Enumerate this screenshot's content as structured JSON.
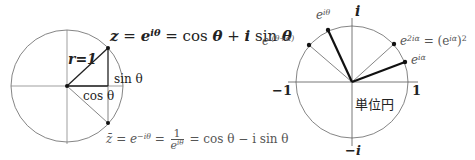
{
  "left_diagram": {
    "radius_label": "r=1",
    "z_formula": {
      "lhs": "z",
      "eq1": " = ",
      "exp_base": "e",
      "exp_sup": "iθ",
      "eq2": " = cos ",
      "theta1": "θ",
      "plus": " + ",
      "i": "i",
      "sin": " sin ",
      "theta2": "θ"
    },
    "sin_label": "sin θ",
    "cos_label": "cos θ",
    "conj_formula": {
      "lhs": "z̄ = e",
      "lhs_sup": "−iθ",
      "eq": " = ",
      "frac_num": "1",
      "frac_den_base": "e",
      "frac_den_sup": "iθ",
      "rhs": " = cos θ − i sin θ"
    }
  },
  "right_diagram": {
    "axis_i": "i",
    "axis_neg_i": "−i",
    "axis_pos_1": "1",
    "axis_neg_1": "−1",
    "unit_circle_label": "単位円",
    "points": [
      {
        "base": "e",
        "sup": "iθ"
      },
      {
        "base": "e",
        "sup": "i(θ+α)"
      },
      {
        "base": "e",
        "sup": "2iα",
        "suffix": " = (e",
        "suffix_sup": "iα",
        "suffix_end": ")",
        "suffix_sup2": "2"
      },
      {
        "base": "e",
        "sup": "iα"
      }
    ]
  },
  "colors": {
    "line": "#555555",
    "thick": "#111111",
    "text": "#222222"
  }
}
